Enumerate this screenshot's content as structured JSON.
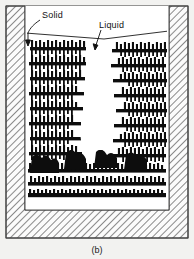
{
  "figure": {
    "caption": "(b)",
    "background_color": "#f2f2f0",
    "frame_color": "#4a4a4a",
    "labels": [
      {
        "id": "solid",
        "text": "Solid",
        "x": 42,
        "y": 17
      },
      {
        "id": "liquid",
        "text": "Liquid",
        "x": 99,
        "y": 27
      }
    ],
    "leaders": [
      {
        "id": "solid-leader",
        "from_x": 41,
        "from_y": 20,
        "to_x": 27,
        "to_y": 34,
        "arrow_x": 27,
        "arrow_y": 42
      },
      {
        "id": "liquid-leader",
        "from_x": 101,
        "from_y": 30,
        "to_x": 96,
        "to_y": 42,
        "arrow_x": 96,
        "arrow_y": 50
      }
    ],
    "crucible": {
      "outer": {
        "x": 6,
        "y": 6,
        "width": 182,
        "height": 232
      },
      "cavity": {
        "x": 27,
        "y": 6,
        "width": 140,
        "height": 206
      },
      "wall_hatch_color": "#2b2b2b",
      "wall_fill": "#fafafa",
      "hatch_angle_deg": 45,
      "hatch_spacing": 5
    },
    "melt_surface": {
      "left_x": 27,
      "left_y": 34,
      "mid_x": 104,
      "mid_y": 39,
      "right_x": 167,
      "right_y": 32
    },
    "regions": [
      {
        "id": "solid-left",
        "name": "columnar-dendrite-zone-left",
        "color": "#0d0d0d"
      },
      {
        "id": "solid-right",
        "name": "columnar-dendrite-zone-right",
        "color": "#0d0d0d"
      },
      {
        "id": "solid-bottom",
        "name": "solidified-base-zone",
        "color": "#0d0d0d"
      },
      {
        "id": "liquid-gap",
        "name": "residual-liquid-pipe",
        "color": "#ffffff"
      }
    ],
    "dendrite_rows": {
      "left_band_x": 36,
      "left_band_w": 48,
      "right_band_x": 108,
      "right_band_w": 50,
      "row_count": 11,
      "row_top": 40,
      "row_step": 14
    }
  }
}
